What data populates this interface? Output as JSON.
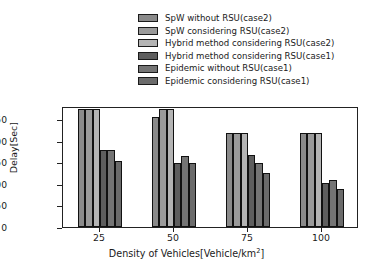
{
  "chart_data": {
    "type": "bar",
    "title": "",
    "xlabel": "Density of Vehicles[Vehicle/km²]",
    "xlabel_base": "Density of Vehicles[Vehicle/km",
    "xlabel_sup": "2",
    "xlabel_tail": "]",
    "ylabel": "Delay[Sec]",
    "categories": [
      "25",
      "50",
      "75",
      "100"
    ],
    "ylim": [
      0,
      1400
    ],
    "yticks": [
      0,
      250,
      500,
      750,
      1000,
      1250
    ],
    "ytick_labels": [
      "0",
      "250",
      "500",
      "750",
      "1000",
      "1250"
    ],
    "grid": false,
    "legend_position": "above-plot",
    "series": [
      {
        "name": "SpW without RSU(case2)",
        "color": "#8a8a8a",
        "values": [
          1360,
          1270,
          1090,
          1085
        ]
      },
      {
        "name": "SpW considering RSU(case2)",
        "color": "#9a9a9a",
        "values": [
          1360,
          1360,
          1090,
          1085
        ]
      },
      {
        "name": "Hybrid method considering RSU(case2)",
        "color": "#b4b4b4",
        "values": [
          1360,
          1360,
          1090,
          1085
        ]
      },
      {
        "name": "Hybrid method considering RSU(case1)",
        "color": "#5e5e5e",
        "values": [
          895,
          735,
          835,
          510
        ]
      },
      {
        "name": "Epidemic without RSU(case1)",
        "color": "#747474",
        "values": [
          895,
          820,
          740,
          545
        ]
      },
      {
        "name": "Epidemic considering RSU(case1)",
        "color": "#6b6b6b",
        "values": [
          760,
          740,
          630,
          435
        ]
      }
    ]
  }
}
